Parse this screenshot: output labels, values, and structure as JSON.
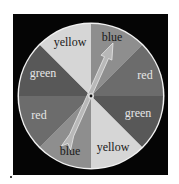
{
  "spinner": {
    "center": {
      "x": 91,
      "y": 96
    },
    "radius": 72,
    "rim_color": "#f2f2f2",
    "frame_color": "#050505",
    "sections": [
      {
        "label": "blue",
        "fill": "#8e8e8e",
        "text_color": "#1a1a1a",
        "start_deg": 0,
        "end_deg": 45,
        "label_x": 112,
        "label_y": 41
      },
      {
        "label": "red",
        "fill": "#6c6c6c",
        "text_color": "#e6e6e6",
        "start_deg": 45,
        "end_deg": 90,
        "label_x": 145,
        "label_y": 79
      },
      {
        "label": "green",
        "fill": "#585858",
        "text_color": "#e6e6e6",
        "start_deg": 90,
        "end_deg": 135,
        "label_x": 138,
        "label_y": 117
      },
      {
        "label": "yellow",
        "fill": "#d6d6d6",
        "text_color": "#1a1a1a",
        "start_deg": 135,
        "end_deg": 180,
        "label_x": 113,
        "label_y": 151
      },
      {
        "label": "blue",
        "fill": "#8e8e8e",
        "text_color": "#1a1a1a",
        "start_deg": 180,
        "end_deg": 225,
        "label_x": 70,
        "label_y": 155
      },
      {
        "label": "red",
        "fill": "#6c6c6c",
        "text_color": "#e6e6e6",
        "start_deg": 225,
        "end_deg": 270,
        "label_x": 39,
        "label_y": 119
      },
      {
        "label": "green",
        "fill": "#585858",
        "text_color": "#e6e6e6",
        "start_deg": 270,
        "end_deg": 315,
        "label_x": 43,
        "label_y": 77
      },
      {
        "label": "yellow",
        "fill": "#d6d6d6",
        "text_color": "#1a1a1a",
        "start_deg": 315,
        "end_deg": 360,
        "label_x": 70,
        "label_y": 46
      }
    ],
    "arrow": {
      "tip": {
        "x": 113,
        "y": 43
      },
      "tail": {
        "x": 66,
        "y": 148
      },
      "fill": "#b8b8b8",
      "stroke": "#e8e8e8"
    },
    "pivot_icon": "pivot-dot"
  }
}
